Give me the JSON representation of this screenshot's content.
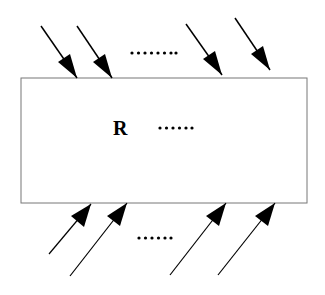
{
  "region": {
    "label": "R",
    "ellipsis": "······"
  },
  "top_ellipsis": "········",
  "bottom_ellipsis": "······",
  "colors": {
    "stroke": "#000000",
    "border": "#777777"
  }
}
